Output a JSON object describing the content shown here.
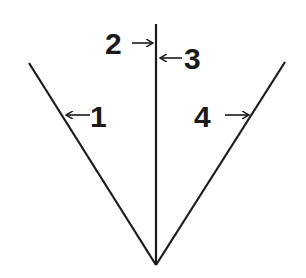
{
  "diagram": {
    "labels": [
      {
        "id": "1",
        "text": "1"
      },
      {
        "id": "2",
        "text": "2"
      },
      {
        "id": "3",
        "text": "3"
      },
      {
        "id": "4",
        "text": "4"
      }
    ],
    "line_color": "#1a1a1a",
    "background": "#ffffff"
  }
}
